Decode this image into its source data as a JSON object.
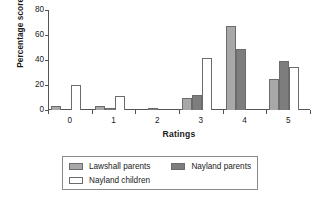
{
  "chart_data": {
    "type": "bar",
    "title": "",
    "subtitle": "",
    "xlabel": "Ratings",
    "ylabel": "Percentage scores",
    "categories": [
      "0",
      "1",
      "2",
      "3",
      "4",
      "5"
    ],
    "ylim": [
      0,
      80
    ],
    "yticks": [
      0,
      20,
      40,
      60,
      80
    ],
    "ytick_labels": [
      "0",
      "20",
      "40",
      "60",
      "80"
    ],
    "grid": false,
    "legend_position": "bottom",
    "series": [
      {
        "name": "Lawshall parents",
        "color": "#a8a8a8",
        "values": [
          3,
          3,
          0,
          10,
          67,
          25
        ]
      },
      {
        "name": "Nayland parents",
        "color": "#7d7d7d",
        "values": [
          0,
          2,
          2,
          12,
          49,
          39
        ]
      },
      {
        "name": "Nayland children",
        "color": "#ffffff",
        "values": [
          20,
          11,
          0,
          42,
          0,
          34.5
        ]
      }
    ],
    "annotations": []
  },
  "legend": {
    "entries": [
      {
        "label": "Lawshall parents",
        "swatch": "s0"
      },
      {
        "label": "Nayland parents",
        "swatch": "s1"
      },
      {
        "label": "Nayland children",
        "swatch": "s2"
      }
    ]
  }
}
